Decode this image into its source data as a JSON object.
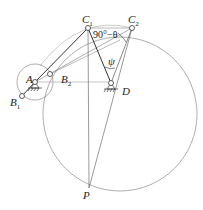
{
  "diagram": {
    "type": "four-bar linkage geometric construction",
    "points": {
      "A": {
        "label": "A",
        "x": 35,
        "y": 82
      },
      "B1": {
        "label": "B",
        "sub": "1",
        "x": 22,
        "y": 96
      },
      "B2": {
        "label": "B",
        "sub": "2",
        "x": 50,
        "y": 74
      },
      "C1": {
        "label": "C",
        "sub": "1",
        "x": 88,
        "y": 28
      },
      "C2": {
        "label": "C",
        "sub": "2",
        "x": 132,
        "y": 28
      },
      "D": {
        "label": "D",
        "x": 111,
        "y": 83
      },
      "P": {
        "label": "P",
        "x": 89,
        "y": 188
      }
    },
    "angles": {
      "c2_angle": "90°−θ",
      "psi": "ψ"
    },
    "colors": {
      "line": "#333333",
      "thin": "#888888"
    }
  }
}
